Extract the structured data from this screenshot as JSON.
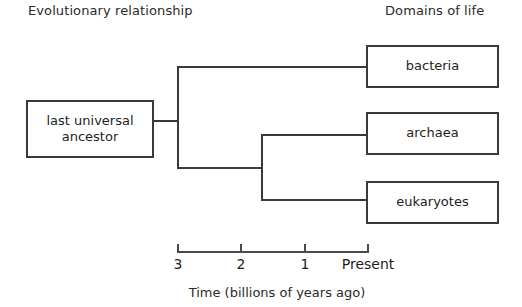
{
  "headings": {
    "left": "Evolutionary relationship",
    "right": "Domains of life"
  },
  "colors": {
    "background": "#ffffff",
    "line": "#3a3a3a",
    "axis": "#4a4a4a",
    "text": "#1d1d1d"
  },
  "chart_data": {
    "type": "diagram",
    "xlabel": "Time (billions of years ago)",
    "ylabel": "",
    "axis": {
      "orientation": "horizontal",
      "direction": "past-to-present",
      "ticks": [
        {
          "label": "3",
          "value": 3,
          "x": 178
        },
        {
          "label": "2",
          "value": 2,
          "x": 241
        },
        {
          "label": "1",
          "value": 1,
          "x": 305
        },
        {
          "label": "Present",
          "value": 0,
          "x": 368
        }
      ],
      "range": [
        3,
        0
      ],
      "grid": false
    },
    "root": {
      "name": "last universal ancestor",
      "label_lines": [
        "last universal",
        "ancestor"
      ]
    },
    "nodes": [
      {
        "id": "node-1",
        "type": "branch-point",
        "time_bya": 3.0,
        "children": [
          "bacteria",
          "node-2"
        ]
      },
      {
        "id": "node-2",
        "type": "branch-point",
        "time_bya": 2.3,
        "children": [
          "archaea",
          "eukaryotes"
        ]
      }
    ],
    "leaves": [
      {
        "id": "bacteria",
        "label": "bacteria"
      },
      {
        "id": "archaea",
        "label": "archaea"
      },
      {
        "id": "eukaryotes",
        "label": "eukaryotes"
      }
    ]
  },
  "boxes": {
    "luca_line1": "last universal",
    "luca_line2": "ancestor",
    "bacteria": "bacteria",
    "archaea": "archaea",
    "eukaryotes": "eukaryotes"
  },
  "axis": {
    "caption": "Time (billions of years ago)",
    "tick_labels": [
      "3",
      "2",
      "1",
      "Present"
    ]
  }
}
